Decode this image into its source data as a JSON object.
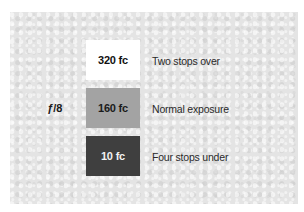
{
  "aperture": {
    "prefix": "ƒ",
    "value": "/8"
  },
  "rows": [
    {
      "illuminance": "320 fc",
      "description": "Two stops over",
      "swatch_color": "#ffffff"
    },
    {
      "illuminance": "160 fc",
      "description": "Normal exposure",
      "swatch_color": "#a3a3a3"
    },
    {
      "illuminance": "10 fc",
      "description": "Four stops under",
      "swatch_color": "#3f3f3f"
    }
  ]
}
